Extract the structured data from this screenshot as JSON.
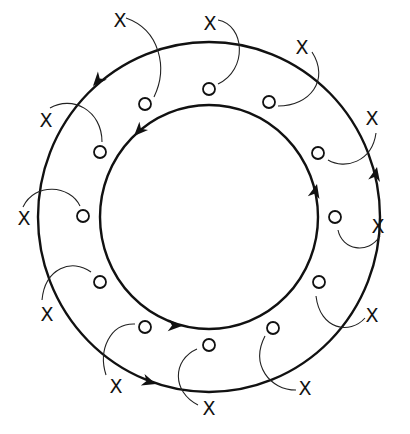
{
  "diagram": {
    "type": "two concentric circulation loops with paired particles",
    "colors": {
      "line": "#111111",
      "background": "#ffffff"
    },
    "center": [
      209,
      217
    ],
    "outer_loop": {
      "rx": 171,
      "ry": 175,
      "direction": "counter-clockwise"
    },
    "inner_loop": {
      "rx": 109,
      "ry": 112,
      "direction": "counter-clockwise"
    },
    "x_marker_label": "X",
    "o_marker_label": "O",
    "x_markers": [
      {
        "x": 120,
        "y": 20,
        "label": "X"
      },
      {
        "x": 210,
        "y": 23,
        "label": "X"
      },
      {
        "x": 302,
        "y": 47,
        "label": "X"
      },
      {
        "x": 46,
        "y": 120,
        "label": "X"
      },
      {
        "x": 372,
        "y": 118,
        "label": "X"
      },
      {
        "x": 24,
        "y": 218,
        "label": "X"
      },
      {
        "x": 378,
        "y": 226,
        "label": "X"
      },
      {
        "x": 47,
        "y": 314,
        "label": "X"
      },
      {
        "x": 372,
        "y": 315,
        "label": "X"
      },
      {
        "x": 116,
        "y": 386,
        "label": "X"
      },
      {
        "x": 305,
        "y": 388,
        "label": "X"
      },
      {
        "x": 209,
        "y": 408,
        "label": "X"
      }
    ],
    "o_markers": [
      {
        "x": 209,
        "y": 89
      },
      {
        "x": 269,
        "y": 102
      },
      {
        "x": 145,
        "y": 104
      },
      {
        "x": 100,
        "y": 152
      },
      {
        "x": 318,
        "y": 153
      },
      {
        "x": 335,
        "y": 217
      },
      {
        "x": 83,
        "y": 216
      },
      {
        "x": 100,
        "y": 282
      },
      {
        "x": 319,
        "y": 282
      },
      {
        "x": 145,
        "y": 327
      },
      {
        "x": 273,
        "y": 328
      },
      {
        "x": 209,
        "y": 345
      }
    ]
  }
}
